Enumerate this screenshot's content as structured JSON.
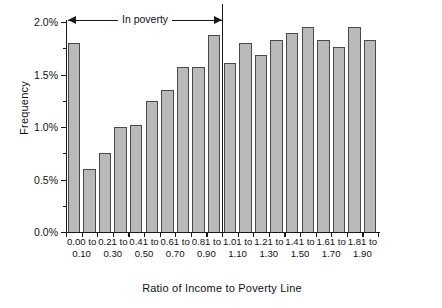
{
  "chart_data": {
    "type": "bar",
    "title": "",
    "xlabel": "Ratio of Income to Poverty Line",
    "ylabel": "Frequency",
    "ylim": [
      0,
      2.0
    ],
    "y_tick_labels": [
      "0.0%",
      "0.5%",
      "1.0%",
      "1.5%",
      "2.0%"
    ],
    "y_tick_values": [
      0,
      0.5,
      1.0,
      1.5,
      2.0
    ],
    "y_minor_tick_values": [
      0.25,
      0.75,
      1.25,
      1.75
    ],
    "grid": false,
    "legend": "none",
    "bar_fill_color": "#b9b9b9",
    "bar_edge_color": "#4a4a4a",
    "axis_color": "#1a1a1a",
    "categories": [
      "0.00 to 0.10",
      "0.11 to 0.20",
      "0.21 to 0.30",
      "0.31 to 0.40",
      "0.41 to 0.50",
      "0.51 to 0.60",
      "0.61 to 0.70",
      "0.71 to 0.80",
      "0.81 to 0.90",
      "0.91 to 1.00",
      "1.01 to 1.10",
      "1.11 to 1.20",
      "1.21 to 1.30",
      "1.31 to 1.40",
      "1.41 to 1.50",
      "1.51 to 1.60",
      "1.61 to 1.70",
      "1.71 to 1.80",
      "1.81 to 1.90",
      "1.91 to 2.00"
    ],
    "values": [
      1.8,
      0.6,
      0.75,
      1.0,
      1.02,
      1.25,
      1.35,
      1.57,
      1.57,
      1.88,
      1.61,
      1.8,
      1.69,
      1.83,
      1.9,
      1.95,
      1.83,
      1.76,
      1.95,
      1.83
    ],
    "visible_x_tick_labels": [
      {
        "index": 0,
        "line1": "0.00 to",
        "line2": "0.10"
      },
      {
        "index": 2,
        "line1": "0.21 to",
        "line2": "0.30"
      },
      {
        "index": 4,
        "line1": "0.41 to",
        "line2": "0.50"
      },
      {
        "index": 6,
        "line1": "0.61 to",
        "line2": "0.70"
      },
      {
        "index": 8,
        "line1": "0.81 to",
        "line2": "0.90"
      },
      {
        "index": 10,
        "line1": "1.01 to",
        "line2": "1.10"
      },
      {
        "index": 12,
        "line1": "1.21 to",
        "line2": "1.30"
      },
      {
        "index": 14,
        "line1": "1.41 to",
        "line2": "1.50"
      },
      {
        "index": 16,
        "line1": "1.61 to",
        "line2": "1.70"
      },
      {
        "index": 18,
        "line1": "1.81 to",
        "line2": "1.90"
      }
    ],
    "annotations": [
      {
        "text": "In poverty",
        "type": "double-headed-arrow",
        "spans_categories": [
          0,
          9
        ],
        "threshold_after_category": 9
      }
    ]
  }
}
